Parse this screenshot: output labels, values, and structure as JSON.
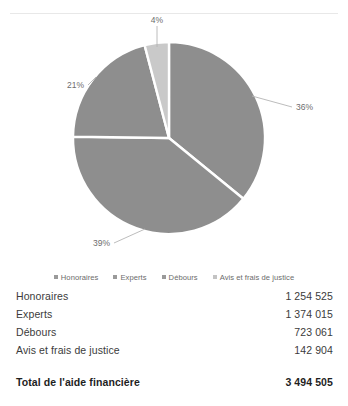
{
  "chart_data": {
    "type": "pie",
    "title": "",
    "categories": [
      "Honoraires",
      "Experts",
      "Débours",
      "Avis et frais de justice"
    ],
    "values": [
      1254525,
      1374015,
      723061,
      142904
    ],
    "percent_labels": [
      "36%",
      "39%",
      "21%",
      "4%"
    ],
    "slice_order_from_12oclock": [
      "Honoraires",
      "Experts",
      "Débours",
      "Avis et frais de justice"
    ],
    "colors": [
      "#8e8e8e",
      "#8e8e8e",
      "#8e8e8e",
      "#c9c9c9"
    ],
    "legend_position": "bottom",
    "grid": false,
    "total_label": "Total de l'aide financière",
    "total_value": 3494505
  },
  "legend": {
    "items": [
      {
        "label": "Honoraires",
        "marker": "legend-marker-square"
      },
      {
        "label": "Experts",
        "marker": "legend-marker-square"
      },
      {
        "label": "Débours",
        "marker": "legend-marker-square"
      },
      {
        "label": "Avis et frais de justice",
        "marker": "legend-marker-square"
      }
    ]
  },
  "pie_labels": {
    "honoraires_pct": "36%",
    "experts_pct": "39%",
    "debours_pct": "21%",
    "avis_pct": "4%"
  },
  "table": {
    "rows": [
      {
        "name": "Honoraires",
        "value": "1 254 525"
      },
      {
        "name": "Experts",
        "value": "1 374 015"
      },
      {
        "name": "Débours",
        "value": "723 061"
      },
      {
        "name": "Avis et frais de justice",
        "value": "142 904"
      }
    ],
    "total": {
      "name": "Total de l'aide financière",
      "value": "3 494 505"
    }
  }
}
